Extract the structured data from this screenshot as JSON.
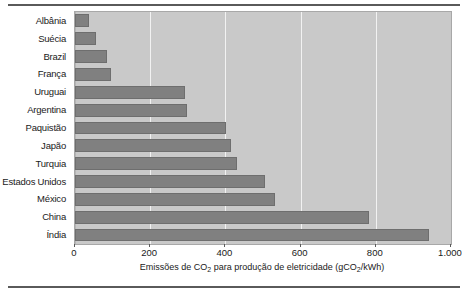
{
  "chart_data": {
    "type": "bar",
    "orientation": "horizontal",
    "title": "",
    "xlabel": "Emissões de CO2 para produção de eletricidade (gCO2/kWh)",
    "xlabel_parts": {
      "a": "Emissões de CO",
      "sub1": "2",
      "b": " para produção de eletricidade (gCO",
      "sub2": "2",
      "c": "/kWh)"
    },
    "ylabel": "",
    "categories": [
      "Albânia",
      "Suécia",
      "Brazil",
      "França",
      "Uruguai",
      "Argentina",
      "Paquistão",
      "Japão",
      "Turquia",
      "Estados Unidos",
      "México",
      "China",
      "Índia"
    ],
    "values": [
      37,
      56,
      85,
      96,
      293,
      298,
      402,
      415,
      431,
      505,
      532,
      782,
      941
    ],
    "xlim": [
      0,
      1000
    ],
    "xticks": [
      0,
      200,
      400,
      600,
      800,
      1000
    ],
    "xtick_labels": [
      "0",
      "200",
      "400",
      "600",
      "800",
      "1.000"
    ],
    "grid": true,
    "grid_axis": "x",
    "legend": null,
    "colors": {
      "bar": "#808080",
      "bar_edge": "#6e6e6e",
      "plot_background": "#c9c9c9",
      "gridline": "#f2f2f2",
      "text": "#1a1a1a",
      "rule": "#5a5a5a",
      "page_background": "#ffffff"
    }
  }
}
